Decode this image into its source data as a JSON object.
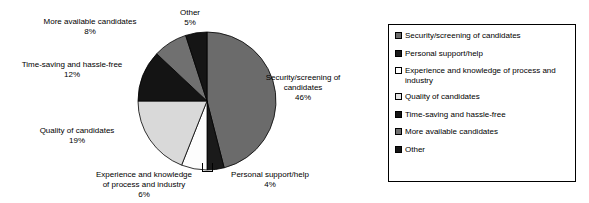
{
  "chart_data": {
    "type": "pie",
    "title": "",
    "subtitle": "",
    "xlabel": "",
    "ylabel": "",
    "legend_position": "right",
    "grid": false,
    "start_angle_deg": 0,
    "direction": "clockwise",
    "categories": [
      "Security/screening of candidates",
      "Personal support/help",
      "Experience and knowledge of process and industry",
      "Quality of candidates",
      "Time-saving and hassle-free",
      "More available candidates",
      "Other"
    ],
    "values": [
      46,
      4,
      6,
      19,
      12,
      8,
      5
    ],
    "value_labels": [
      "46%",
      "4%",
      "6%",
      "19%",
      "12%",
      "8%",
      "5%"
    ],
    "colors": [
      "#6b6b6b",
      "#1a1a1a",
      "#fdfdfd",
      "#d9d9d9",
      "#141414",
      "#707070",
      "#151515"
    ],
    "slice_outline_color": "#000000",
    "units": "percent"
  },
  "pie": {
    "callouts": [
      {
        "name": "other",
        "label": "Other",
        "pct": "5%",
        "align": "center"
      },
      {
        "name": "more",
        "label": "More available candidates",
        "pct": "8%",
        "align": "center"
      },
      {
        "name": "time",
        "label": "Time-saving and hassle-free",
        "pct": "12%",
        "align": "center"
      },
      {
        "name": "quality",
        "label": "Quality of candidates",
        "pct": "19%",
        "align": "center"
      },
      {
        "name": "experience",
        "label_line1": "Experience and knowledge",
        "label_line2": "of process and industry",
        "pct": "6%",
        "align": "center"
      },
      {
        "name": "personal",
        "label": "Personal support/help",
        "pct": "4%",
        "align": "center"
      },
      {
        "name": "security",
        "label_line1": "Security/screening of",
        "label_line2": "candidates",
        "pct": "46%",
        "align": "center"
      }
    ]
  },
  "legend": {
    "items": [
      {
        "label": "Security/screening of candidates",
        "color": "#6b6b6b"
      },
      {
        "label": "Personal support/help",
        "color": "#1a1a1a"
      },
      {
        "label": "Experience and knowledge of process and industry",
        "color": "#ffffff"
      },
      {
        "label": "Quality of candidates",
        "color": "#e3e3e3"
      },
      {
        "label": "Time-saving and hassle-free",
        "color": "#141414"
      },
      {
        "label": "More available candidates",
        "color": "#707070"
      },
      {
        "label": "Other",
        "color": "#151515"
      }
    ]
  }
}
